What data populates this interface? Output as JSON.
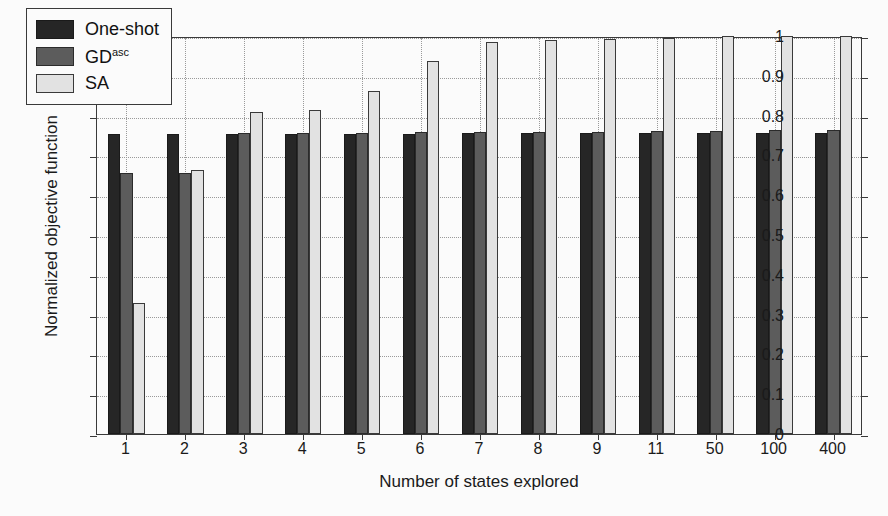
{
  "chart_data": {
    "type": "bar",
    "title": "",
    "xlabel": "Number of states explored",
    "ylabel": "Normalized objective function",
    "categories": [
      "1",
      "2",
      "3",
      "4",
      "5",
      "6",
      "7",
      "8",
      "9",
      "11",
      "50",
      "100",
      "400"
    ],
    "ylim": [
      0,
      1
    ],
    "yticks": [
      0,
      0.1,
      0.2,
      0.3,
      0.4,
      0.5,
      0.6,
      0.7,
      0.8,
      0.9,
      1
    ],
    "ytick_labels": [
      "0",
      "0.1",
      "0.2",
      "0.3",
      "0.4",
      "0.5",
      "0.6",
      "0.7",
      "0.8",
      "0.9",
      "1"
    ],
    "grid": true,
    "legend_position": "upper-left",
    "series": [
      {
        "name": "One-shot",
        "color": "#262626",
        "values": [
          0.753,
          0.753,
          0.753,
          0.753,
          0.753,
          0.755,
          0.756,
          0.756,
          0.756,
          0.757,
          0.757,
          0.757,
          0.757
        ]
      },
      {
        "name": "GD",
        "name_sup": "asc",
        "color": "#5c5c5c",
        "values": [
          0.655,
          0.657,
          0.757,
          0.757,
          0.757,
          0.758,
          0.759,
          0.76,
          0.76,
          0.761,
          0.762,
          0.764,
          0.764
        ]
      },
      {
        "name": "SA",
        "color": "#e2e2e2",
        "values": [
          0.33,
          0.663,
          0.81,
          0.815,
          0.862,
          0.937,
          0.985,
          0.991,
          0.992,
          0.996,
          1.0,
          1.0,
          1.0
        ]
      }
    ]
  },
  "legend": {
    "entries": [
      {
        "label": "One-shot",
        "sup": ""
      },
      {
        "label": "GD",
        "sup": "asc"
      },
      {
        "label": "SA",
        "sup": ""
      }
    ]
  }
}
